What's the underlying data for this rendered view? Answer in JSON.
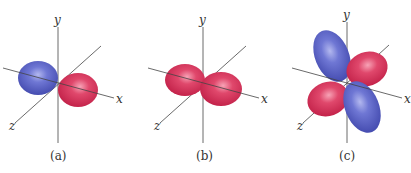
{
  "figure": {
    "panels": [
      {
        "id": "a",
        "caption": "(a)",
        "axes": {
          "x": "x",
          "y": "y",
          "z": "z"
        },
        "lobes": [
          {
            "position": "negative-x",
            "phase": "negative",
            "color": "#5b63c6"
          },
          {
            "position": "positive-x",
            "phase": "positive",
            "color": "#d8365e"
          }
        ]
      },
      {
        "id": "b",
        "caption": "(b)",
        "axes": {
          "x": "x",
          "y": "y",
          "z": "z"
        },
        "lobes": [
          {
            "position": "negative-x",
            "phase": "positive",
            "color": "#d8365e"
          },
          {
            "position": "positive-x",
            "phase": "positive",
            "color": "#d8365e"
          }
        ]
      },
      {
        "id": "c",
        "caption": "(c)",
        "axes": {
          "x": "x",
          "y": "y",
          "z": "z"
        },
        "lobes": [
          {
            "position": "upper-left",
            "phase": "negative",
            "color": "#5b63c6"
          },
          {
            "position": "upper-right",
            "phase": "positive",
            "color": "#d8365e"
          },
          {
            "position": "lower-left",
            "phase": "positive",
            "color": "#d8365e"
          },
          {
            "position": "lower-right",
            "phase": "negative",
            "color": "#5b63c6"
          }
        ]
      }
    ],
    "colors": {
      "positive_lobe": "#d8365e",
      "negative_lobe": "#5b63c6",
      "axis_line": "#444444"
    }
  }
}
